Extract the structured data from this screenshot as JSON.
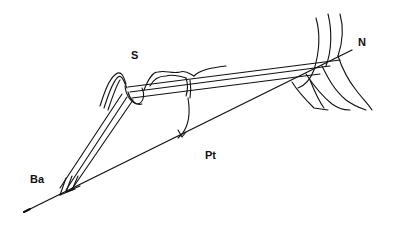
{
  "diagram": {
    "type": "cephalometric-superimposition",
    "landmarks": [
      {
        "id": "S",
        "label": "S",
        "x": 131,
        "y": 56
      },
      {
        "id": "N",
        "label": "N",
        "x": 360,
        "y": 42
      },
      {
        "id": "Ba",
        "label": "Ba",
        "x": 31,
        "y": 180
      },
      {
        "id": "Pt",
        "label": "Pt",
        "x": 206,
        "y": 156
      }
    ],
    "lines": [
      {
        "name": "basion-nasion-line",
        "from": "Ba",
        "to": "N"
      },
      {
        "name": "sella-nasion-lines",
        "count": 3
      },
      {
        "name": "sella-basion-lines",
        "count": 3
      }
    ],
    "colors": {
      "stroke": "#111111",
      "background": "#ffffff"
    }
  }
}
